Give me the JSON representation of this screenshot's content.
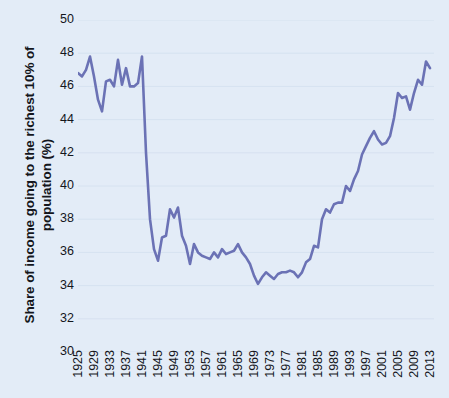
{
  "chart_data": {
    "type": "line",
    "title": "",
    "xlabel": "",
    "ylabel": "Share of income going to the richest 10% of population (%)",
    "ylim": [
      30,
      50
    ],
    "xlim": [
      1925,
      2014
    ],
    "grid": true,
    "legend": "none",
    "line_color": "#6b72b5",
    "background_color": "#e3ecf7",
    "text_color": "#14161c",
    "gridline_color": "#d6e2f0",
    "y_ticks": [
      50,
      48,
      46,
      44,
      42,
      40,
      38,
      36,
      34,
      32,
      30
    ],
    "x_ticks": [
      1925,
      1929,
      1933,
      1937,
      1941,
      1945,
      1949,
      1953,
      1957,
      1961,
      1965,
      1969,
      1973,
      1977,
      1981,
      1985,
      1989,
      1993,
      1997,
      2001,
      2005,
      2009,
      2013
    ],
    "x": [
      1925,
      1926,
      1927,
      1928,
      1929,
      1930,
      1931,
      1932,
      1933,
      1934,
      1935,
      1936,
      1937,
      1938,
      1939,
      1940,
      1941,
      1942,
      1943,
      1944,
      1945,
      1946,
      1947,
      1948,
      1949,
      1950,
      1951,
      1952,
      1953,
      1954,
      1955,
      1956,
      1957,
      1958,
      1959,
      1960,
      1961,
      1962,
      1963,
      1964,
      1965,
      1966,
      1967,
      1968,
      1969,
      1970,
      1971,
      1972,
      1973,
      1974,
      1975,
      1976,
      1977,
      1978,
      1979,
      1980,
      1981,
      1982,
      1983,
      1984,
      1985,
      1986,
      1987,
      1988,
      1989,
      1990,
      1991,
      1992,
      1993,
      1994,
      1995,
      1996,
      1997,
      1998,
      1999,
      2000,
      2001,
      2002,
      2003,
      2004,
      2005,
      2006,
      2007,
      2008,
      2009,
      2010,
      2011,
      2012,
      2013
    ],
    "values": [
      46.8,
      46.6,
      47.0,
      47.8,
      46.6,
      45.2,
      44.5,
      46.3,
      46.4,
      46.0,
      47.6,
      46.1,
      47.1,
      46.0,
      46.0,
      46.2,
      47.8,
      42.0,
      38.0,
      36.2,
      35.5,
      36.9,
      37.0,
      38.6,
      38.1,
      38.7,
      37.0,
      36.4,
      35.3,
      36.5,
      36.0,
      35.8,
      35.7,
      35.6,
      36.0,
      35.7,
      36.2,
      35.9,
      36.0,
      36.1,
      36.5,
      36.0,
      35.7,
      35.3,
      34.6,
      34.1,
      34.5,
      34.8,
      34.6,
      34.4,
      34.7,
      34.8,
      34.8,
      34.9,
      34.8,
      34.5,
      34.8,
      35.4,
      35.6,
      36.4,
      36.3,
      38.0,
      38.6,
      38.4,
      38.9,
      39.0,
      39.0,
      40.0,
      39.7,
      40.4,
      40.9,
      41.9,
      42.4,
      42.9,
      43.3,
      42.8,
      42.5,
      42.6,
      43.0,
      44.1,
      45.6,
      45.3,
      45.4,
      44.6,
      45.6,
      46.4,
      46.1,
      47.5,
      47.1
    ]
  }
}
